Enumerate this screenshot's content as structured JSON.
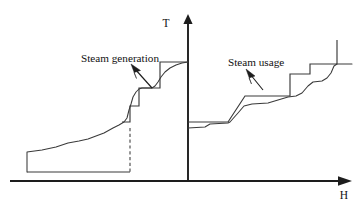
{
  "figure": {
    "background_color": "#ffffff",
    "line_color": "#3a3a3a",
    "axis_color": "#1d1d1d",
    "axes": {
      "y_label": "T",
      "x_label": "H",
      "y_axis_x": 188,
      "x_axis_y": 181,
      "y_label_pos": {
        "x": 166,
        "y": 26
      },
      "x_label_pos": {
        "x": 344,
        "y": 195
      }
    },
    "annotations": [
      {
        "id": "steam-generation",
        "text": "Steam generation",
        "text_x": 81,
        "text_y": 58,
        "pointer_from": {
          "x": 152,
          "y": 88
        },
        "pointer_to": {
          "x": 132,
          "y": 65
        }
      },
      {
        "id": "steam-usage",
        "text": "Steam usage",
        "text_x": 228,
        "text_y": 62,
        "pointer_from": {
          "x": 263,
          "y": 90
        },
        "pointer_to": {
          "x": 247,
          "y": 70
        }
      }
    ]
  },
  "chart_data": {
    "type": "line",
    "xlabel": "H",
    "ylabel": "T",
    "grid": false,
    "legend": "none",
    "note": "Pixel-space polyline vertices; y is measured downward from the top of the 359x205 canvas. Lower y = higher temperature T. Left half of the H axis holds the steam generation curves, right half holds the steam usage curves.",
    "axis_ranges": {
      "x_pixels": [
        10,
        352
      ],
      "y_pixels": [
        14,
        181
      ]
    },
    "series": [
      {
        "name": "steam-generation-baseline",
        "kind": "step",
        "description": "Flat low baseline running right from the start of the generation curve to the dashed drop line",
        "points": [
          [
            27,
            172
          ],
          [
            130,
            172
          ]
        ]
      },
      {
        "name": "steam-generation-smooth",
        "kind": "line",
        "description": "Smoothly rising hot stream curve: vertical start riser then gradual climb, a steeper climb, a shelf, a notch dip and a final rise to the T axis",
        "points": [
          [
            27,
            172
          ],
          [
            27,
            152
          ],
          [
            42,
            150
          ],
          [
            56,
            147
          ],
          [
            68,
            143
          ],
          [
            79,
            141
          ],
          [
            88,
            139
          ],
          [
            96,
            136
          ],
          [
            104,
            133
          ],
          [
            113,
            128
          ],
          [
            119,
            125
          ],
          [
            124,
            122
          ],
          [
            127,
            118
          ],
          [
            129,
            110
          ],
          [
            131,
            104
          ],
          [
            133,
            97
          ],
          [
            136,
            92
          ],
          [
            139,
            89
          ],
          [
            142,
            88
          ],
          [
            148,
            88
          ],
          [
            152,
            88
          ],
          [
            155,
            86
          ],
          [
            158,
            82
          ],
          [
            161,
            77
          ],
          [
            165,
            72
          ],
          [
            170,
            68
          ],
          [
            176,
            65
          ],
          [
            182,
            63
          ],
          [
            188,
            62
          ]
        ]
      },
      {
        "name": "steam-generation-step",
        "kind": "step",
        "description": "Stepped (staircase) composite curve for steam generation sitting on top of the smooth curve",
        "points": [
          [
            122,
            122
          ],
          [
            130,
            122
          ],
          [
            130,
            106
          ],
          [
            139,
            106
          ],
          [
            139,
            88
          ],
          [
            160,
            88
          ],
          [
            160,
            62
          ],
          [
            188,
            62
          ]
        ]
      },
      {
        "name": "steam-generation-drop-dashed",
        "kind": "dashed",
        "description": "Dashed vertical construction line dropping from the generation curve down to the baseline",
        "points": [
          [
            130,
            128
          ],
          [
            130,
            172
          ]
        ]
      },
      {
        "name": "steam-usage-step",
        "kind": "step",
        "description": "Stepped composite curve for steam usage, rising left-to-right in flat plateaus",
        "points": [
          [
            188,
            122
          ],
          [
            228,
            122
          ],
          [
            245,
            96
          ],
          [
            290,
            96
          ],
          [
            290,
            74
          ],
          [
            310,
            74
          ],
          [
            310,
            64
          ],
          [
            337,
            64
          ],
          [
            337,
            40
          ]
        ]
      },
      {
        "name": "steam-usage-smooth",
        "kind": "line",
        "description": "Smoother steam usage stream curve interleaving with the stepped curve",
        "points": [
          [
            188,
            128
          ],
          [
            205,
            127
          ],
          [
            210,
            124
          ],
          [
            228,
            123
          ],
          [
            230,
            122
          ],
          [
            238,
            113
          ],
          [
            244,
            106
          ],
          [
            252,
            104
          ],
          [
            268,
            103
          ],
          [
            278,
            100
          ],
          [
            288,
            97
          ],
          [
            296,
            96
          ],
          [
            302,
            93
          ],
          [
            308,
            86
          ],
          [
            313,
            82
          ],
          [
            322,
            81
          ],
          [
            327,
            78
          ],
          [
            331,
            73
          ],
          [
            334,
            66
          ],
          [
            337,
            64
          ],
          [
            352,
            64
          ]
        ]
      }
    ]
  }
}
